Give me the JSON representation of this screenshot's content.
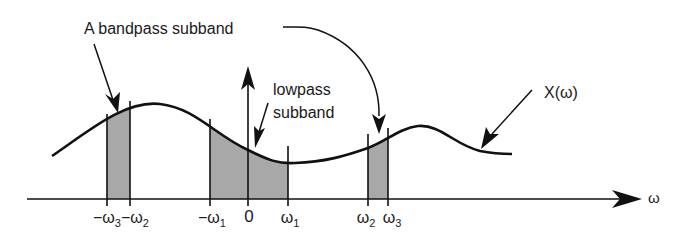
{
  "diagram": {
    "labels": {
      "bandpass": "A bandpass subband",
      "lowpass_line1": "lowpass",
      "lowpass_line2": "subband",
      "spectrum": "X(ω)",
      "axis": "ω"
    },
    "ticks": [
      {
        "id": "neg-w3",
        "label": "−ω",
        "sub": "3",
        "x": 107
      },
      {
        "id": "neg-w2",
        "label": "−ω",
        "sub": "2",
        "x": 130
      },
      {
        "id": "neg-w1",
        "label": "−ω",
        "sub": "1",
        "x": 210
      },
      {
        "id": "zero",
        "label": "0",
        "sub": "",
        "x": 248
      },
      {
        "id": "w1",
        "label": "ω",
        "sub": "1",
        "x": 288
      },
      {
        "id": "w2",
        "label": "ω",
        "sub": "2",
        "x": 368
      },
      {
        "id": "w3",
        "label": "ω",
        "sub": "3",
        "x": 388
      }
    ],
    "colors": {
      "line": "#111111",
      "shade": "#a8a8a8",
      "background": "#ffffff"
    }
  }
}
